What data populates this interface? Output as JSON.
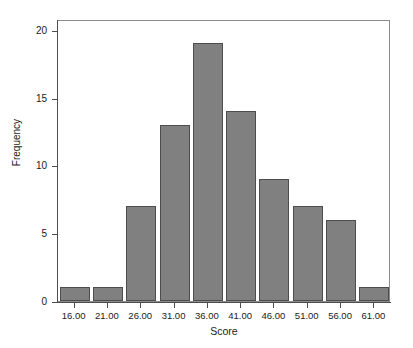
{
  "chart_data": {
    "type": "bar",
    "title": "",
    "subtitle": "",
    "xlabel": "Score",
    "ylabel": "Frequency",
    "categories": [
      "16.00",
      "21.00",
      "26.00",
      "31.00",
      "36.00",
      "41.00",
      "46.00",
      "51.00",
      "56.00",
      "61.00"
    ],
    "values": [
      1,
      1,
      7,
      13,
      19,
      14,
      9,
      7,
      6,
      1
    ],
    "series": [
      {
        "name": "Frequency",
        "values": [
          1,
          1,
          7,
          13,
          19,
          14,
          9,
          7,
          6,
          1
        ]
      }
    ],
    "ylim": [
      0,
      20.8
    ],
    "xlim": [
      13.5,
      63.5
    ],
    "yticks": [
      0,
      5,
      10,
      15,
      20
    ],
    "ytick_labels": [
      "0",
      "5",
      "10",
      "15",
      "20"
    ],
    "xtick_labels": [
      "16.00",
      "21.00",
      "26.00",
      "31.00",
      "36.00",
      "41.00",
      "46.00",
      "51.00",
      "56.00",
      "61.00"
    ],
    "grid": false,
    "legend": null,
    "legend_position": "none",
    "annotations": [],
    "bin_width": 5,
    "total_count": 78,
    "colors": {
      "bar_fill": "#808080",
      "bar_edge": "#4d4d4d",
      "axis": "#4d4d4d",
      "frame": "#8c8c8c",
      "text": "#1a1a1a",
      "background": "#ffffff"
    }
  }
}
